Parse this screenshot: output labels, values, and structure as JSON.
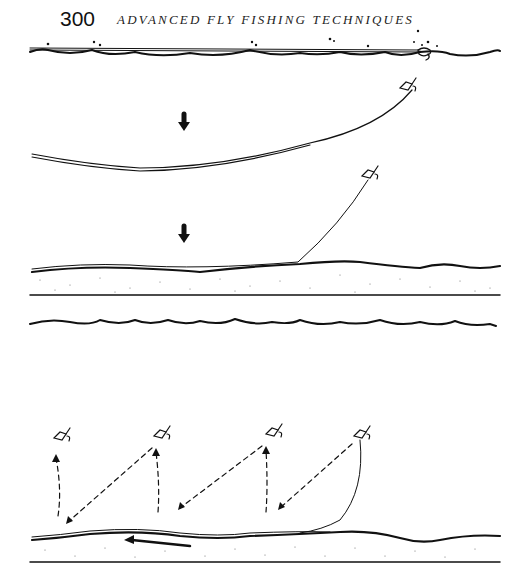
{
  "page": {
    "number": "300",
    "running_head": "ADVANCED FLY FISHING TECHNIQUES"
  },
  "figure": {
    "panels": [
      {
        "name": "upper-sequence",
        "description": "Line on surface, then sinking, then lying on bottom with fly rising"
      },
      {
        "name": "lower-sequence",
        "description": "Fly swimming up and down in steps as line is retrieved along bottom"
      }
    ]
  },
  "colors": {
    "ink": "#111111",
    "paper": "#ffffff"
  }
}
